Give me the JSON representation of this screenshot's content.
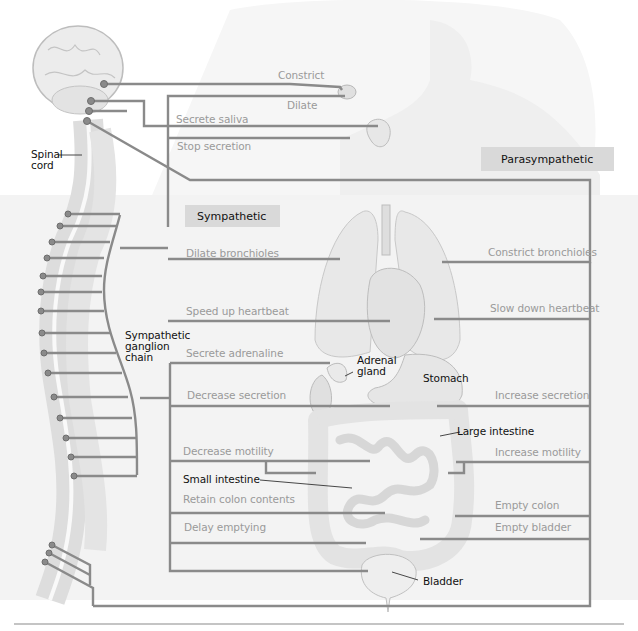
{
  "figure": {
    "colors": {
      "line": "#8a8a8a",
      "organ": "#e6e6e6",
      "organ_stroke": "#c4c4c4",
      "body_shadow": "#f1f1f1",
      "header_box": "#d9d9d9",
      "faint_text": "#9a9a9a",
      "dark_text": "#111111"
    }
  },
  "headers": {
    "sympathetic": "Sympathetic",
    "parasympathetic": "Parasympathetic"
  },
  "anatomy_labels": {
    "spinal_cord": "Spinal\ncord",
    "ganglion_chain": "Sympathetic\nganglion\nchain",
    "adrenal_gland": "Adrenal\ngland",
    "stomach": "Stomach",
    "large_intestine": "Large intestine",
    "small_intestine": "Small intestine",
    "bladder": "Bladder"
  },
  "effects": {
    "eye": {
      "parasympathetic": "Constrict",
      "sympathetic": "Dilate"
    },
    "salivary": {
      "parasympathetic": "Secrete saliva",
      "sympathetic": "Stop secretion"
    },
    "lungs": {
      "sympathetic": "Dilate bronchioles",
      "parasympathetic": "Constrict bronchioles"
    },
    "heart": {
      "sympathetic": "Speed up heartbeat",
      "parasympathetic": "Slow down heartbeat"
    },
    "adrenal": {
      "sympathetic": "Secrete adrenaline"
    },
    "stomach": {
      "sympathetic": "Decrease secretion",
      "parasympathetic": "Increase secretion"
    },
    "intestine": {
      "sympathetic": "Decrease motility",
      "parasympathetic": "Increase motility"
    },
    "colon": {
      "sympathetic": "Retain colon contents",
      "parasympathetic": "Empty colon"
    },
    "bladder": {
      "sympathetic": "Delay emptying",
      "parasympathetic": "Empty bladder"
    }
  }
}
